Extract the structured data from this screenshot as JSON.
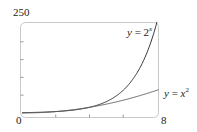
{
  "chart_data": {
    "type": "line",
    "title": "",
    "xlabel": "",
    "ylabel": "",
    "xlim": [
      0,
      8
    ],
    "ylim": [
      0,
      250
    ],
    "tick_labels": {
      "y_top": "250",
      "origin": "0",
      "x_right": "8"
    },
    "x_ticks": [
      0,
      2,
      4,
      6,
      8
    ],
    "y_ticks": [
      0,
      50,
      100,
      150,
      200,
      250
    ],
    "grid": false,
    "series": [
      {
        "name": "y = 2^x",
        "label_var": "y",
        "label_eq": " = 2",
        "label_sup": "x",
        "x": [
          0,
          1,
          2,
          3,
          4,
          5,
          6,
          7,
          8
        ],
        "y": [
          1,
          2,
          4,
          8,
          16,
          32,
          64,
          128,
          256
        ]
      },
      {
        "name": "y = x^2",
        "label_var": "y",
        "label_eq": " = ",
        "label_base": "x",
        "label_sup": "2",
        "x": [
          0,
          1,
          2,
          3,
          4,
          5,
          6,
          7,
          8
        ],
        "y": [
          0,
          1,
          4,
          9,
          16,
          25,
          36,
          49,
          64
        ]
      }
    ]
  }
}
